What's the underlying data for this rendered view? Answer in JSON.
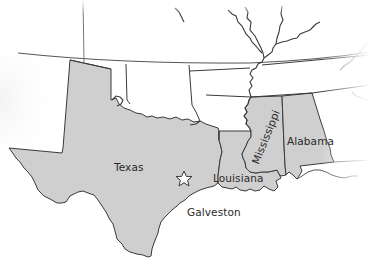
{
  "map": {
    "region": "South-central United States",
    "colors": {
      "highlighted_state_fill": "#cfcfcf",
      "other_land_fill": "#ffffff",
      "border": "#3a3a3a",
      "river": "#3a3a3a",
      "label_text": "#2a2a2a",
      "background": "#ffffff"
    },
    "highlighted_states": [
      {
        "name": "Texas",
        "label": "Texas"
      },
      {
        "name": "Louisiana",
        "label": "Louisiana"
      },
      {
        "name": "Mississippi",
        "label": "Mississippi",
        "label_rotation_deg": -68
      },
      {
        "name": "Alabama",
        "label": "Alabama"
      }
    ],
    "markers": [
      {
        "type": "star",
        "name": "Galveston",
        "label": "Galveston",
        "icon": "star-outline-icon"
      }
    ]
  }
}
